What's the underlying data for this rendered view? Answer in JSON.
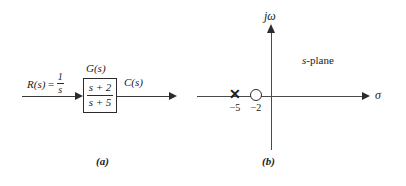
{
  "figure": {
    "background_color": "#ffffff",
    "line_color": "#3a3a3a",
    "text_color": "#1a1a1a"
  },
  "part_a": {
    "caption": "(a)",
    "input_label": {
      "name": "R(s)",
      "equals": "=",
      "numerator": "1",
      "denominator": "s",
      "full_text": "R(s) = 1/s"
    },
    "block": {
      "title": "G(s)",
      "numerator": "s + 2",
      "denominator": "s + 5",
      "transfer_function": "(s + 2)/(s + 5)"
    },
    "output_label": "C(s)"
  },
  "part_b": {
    "caption": "(b)",
    "plane_label_italic": "s",
    "plane_label_rest": "-plane",
    "vertical_axis_label": "jω",
    "horizontal_axis_label": "σ",
    "markers": [
      {
        "type": "pole",
        "glyph": "✕",
        "label": "−5",
        "value": -5
      },
      {
        "type": "zero",
        "glyph": "○",
        "label": "−2",
        "value": -2
      }
    ],
    "pole_label": "−5",
    "zero_label": "−2"
  }
}
